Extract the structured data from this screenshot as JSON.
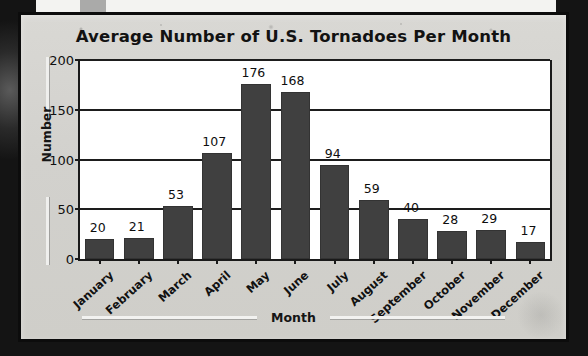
{
  "chart_data": {
    "type": "bar",
    "title": "Average Number of U.S. Tornadoes Per Month",
    "xlabel": "Month",
    "ylabel": "Number",
    "categories": [
      "January",
      "February",
      "March",
      "April",
      "May",
      "June",
      "July",
      "August",
      "September",
      "October",
      "November",
      "December"
    ],
    "values": [
      20,
      21,
      53,
      107,
      176,
      168,
      94,
      59,
      40,
      28,
      29,
      17
    ],
    "value_labels": [
      "20",
      "21",
      "53",
      "107",
      "176",
      "168",
      "94",
      "59",
      "40",
      "28",
      "29",
      "17"
    ],
    "ylim": [
      0,
      200
    ],
    "yticks": [
      0,
      50,
      100,
      150,
      200
    ],
    "ytick_labels": [
      "0",
      "50",
      "100",
      "150",
      "200"
    ],
    "grid": "horizontal",
    "legend": "none",
    "bar_color": "#404040",
    "plot_background": "#ffffff",
    "card_background": "#d5d4d0",
    "axis_color": "#1a1a1a"
  }
}
